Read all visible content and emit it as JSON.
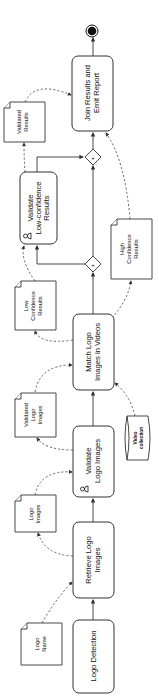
{
  "diagram": {
    "orientation": "rotated-90-ccw",
    "tasks": [
      {
        "id": "logo_detection",
        "line1": "Logo Detection",
        "line2": "",
        "icon": ""
      },
      {
        "id": "retrieve",
        "line1": "Retrieve Logo",
        "line2": "Images",
        "icon": ""
      },
      {
        "id": "validate_logo",
        "line1": "Validate",
        "line2": "Logo Images",
        "icon": "user-task-icon"
      },
      {
        "id": "match",
        "line1": "Match Logo",
        "line2": "Images in Videos",
        "icon": ""
      },
      {
        "id": "validate_low",
        "line1": "Validate",
        "line2": "Low-confidence",
        "line3": "Results",
        "icon": "user-task-icon"
      },
      {
        "id": "join",
        "line1": "Join Results and",
        "line2": "Emit Report",
        "icon": ""
      }
    ],
    "documents": [
      {
        "id": "logo_name",
        "line1": "Logo",
        "line2": "Name"
      },
      {
        "id": "logo_images",
        "line1": "Logo",
        "line2": "Images"
      },
      {
        "id": "validated_logo_images",
        "line1": "Validated",
        "line2": "Logo",
        "line3": "Images"
      },
      {
        "id": "low_conf",
        "line1": "Low",
        "line2": "Confidence",
        "line3": "Results"
      },
      {
        "id": "high_conf",
        "line1": "High",
        "line2": "Confidence",
        "line3": "Results"
      },
      {
        "id": "validated_results",
        "line1": "Validated",
        "line2": "Results"
      }
    ],
    "datastore": {
      "line1": "Video",
      "line2": "collection"
    },
    "gateways": [
      {
        "id": "split",
        "symbol": "+"
      },
      {
        "id": "join",
        "symbol": "+"
      }
    ],
    "end_event": "end-event"
  }
}
